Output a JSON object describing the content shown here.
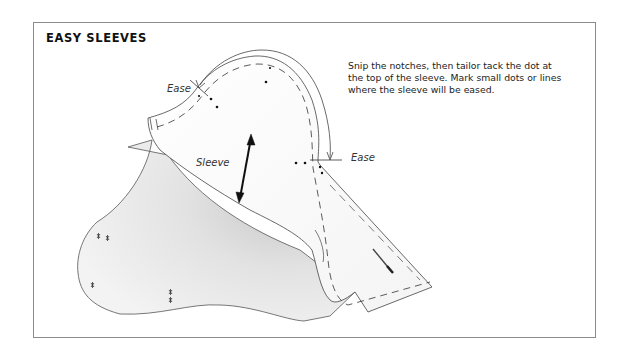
{
  "figure": {
    "title": "EASY SLEEVES",
    "description": "Snip the notches, then tailor tack the dot at the top of the sleeve. Mark small dots or lines where the sleeve will be eased.",
    "labels": {
      "ease_left": "Ease",
      "ease_right": "Ease",
      "sleeve": "Sleeve"
    }
  }
}
